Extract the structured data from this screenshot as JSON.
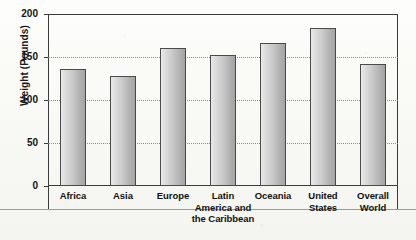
{
  "chart_data": {
    "type": "bar",
    "title": "",
    "xlabel": "",
    "ylabel": "Weight (Pounds)",
    "ylim": [
      0,
      200
    ],
    "yticks": [
      0,
      50,
      100,
      150,
      200
    ],
    "ytick_labels": [
      "0",
      "50",
      "100",
      "150",
      "200"
    ],
    "grid": true,
    "gridlines_at": [
      50,
      100,
      150
    ],
    "legend": "none",
    "categories": [
      "Africa",
      "Asia",
      "Europe",
      "Latin America and the Caribbean",
      "Oceania",
      "United States",
      "Overall World"
    ],
    "category_label_lines": [
      [
        "Africa"
      ],
      [
        "Asia"
      ],
      [
        "Europe"
      ],
      [
        "Latin",
        "America and",
        "the Caribbean"
      ],
      [
        "Oceania"
      ],
      [
        "United",
        "States"
      ],
      [
        "Overall",
        "World"
      ]
    ],
    "values": [
      136,
      128,
      160,
      152,
      166,
      184,
      142
    ],
    "series": [
      {
        "name": "Average Body Weight",
        "values": [
          136,
          128,
          160,
          152,
          166,
          184,
          142
        ]
      }
    ]
  },
  "style": {
    "bar_fill_light": "#e9e9e9",
    "bar_fill_dark": "#a3a3a3",
    "bar_border": "#4a4a4a",
    "axis_color": "#3a3a3a",
    "gridline_color": "#8d8d8a",
    "text_color": "#121212",
    "background": "#fbfbf9"
  }
}
